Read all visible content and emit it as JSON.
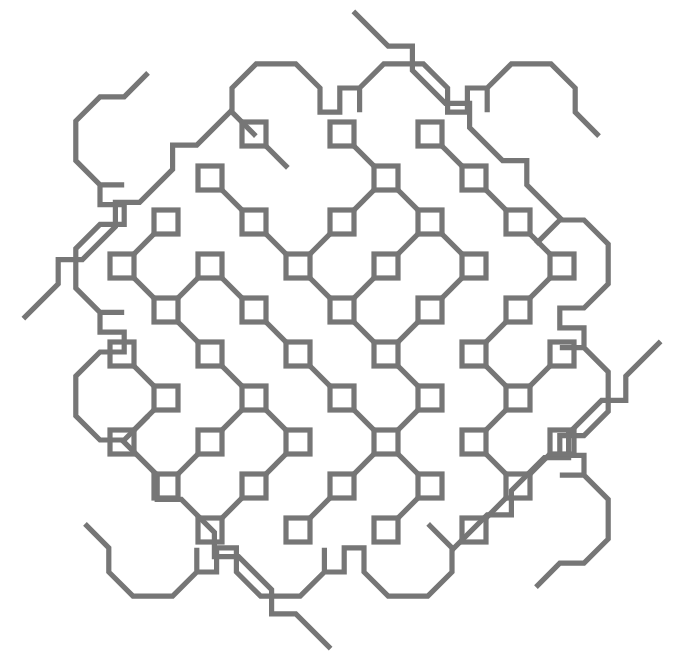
{
  "figure": {
    "type": "line-art",
    "canvas": {
      "width": 685,
      "height": 664,
      "background": "#ffffff"
    },
    "stroke": {
      "color": "#767676",
      "width": 5.2,
      "linecap": "square",
      "linejoin": "miter"
    },
    "lattice": {
      "description": "Diagonal lattice of open square nodes joined by 45-degree links, clipped to an octagonal/circular boundary",
      "center_x": 342,
      "center_y": 330,
      "half_spacing": 44,
      "node_size": 24,
      "node_count": 61,
      "radius": 300
    },
    "nodes": [
      [
        254,
        134
      ],
      [
        342,
        134
      ],
      [
        430,
        134
      ],
      [
        210,
        178
      ],
      [
        386,
        178
      ],
      [
        474,
        178
      ],
      [
        166,
        222
      ],
      [
        254,
        222
      ],
      [
        342,
        222
      ],
      [
        430,
        222
      ],
      [
        518,
        222
      ],
      [
        122,
        266
      ],
      [
        210,
        266
      ],
      [
        298,
        266
      ],
      [
        386,
        266
      ],
      [
        474,
        266
      ],
      [
        562,
        266
      ],
      [
        166,
        310
      ],
      [
        254,
        310
      ],
      [
        342,
        310
      ],
      [
        430,
        310
      ],
      [
        518,
        310
      ],
      [
        122,
        354
      ],
      [
        210,
        354
      ],
      [
        298,
        354
      ],
      [
        386,
        354
      ],
      [
        474,
        354
      ],
      [
        562,
        354
      ],
      [
        166,
        398
      ],
      [
        254,
        398
      ],
      [
        342,
        398
      ],
      [
        430,
        398
      ],
      [
        518,
        398
      ],
      [
        122,
        442
      ],
      [
        210,
        442
      ],
      [
        298,
        442
      ],
      [
        386,
        442
      ],
      [
        474,
        442
      ],
      [
        562,
        442
      ],
      [
        166,
        486
      ],
      [
        254,
        486
      ],
      [
        342,
        486
      ],
      [
        430,
        486
      ],
      [
        518,
        486
      ],
      [
        210,
        530
      ],
      [
        298,
        530
      ],
      [
        386,
        530
      ],
      [
        474,
        530
      ]
    ],
    "links": [
      [
        254,
        134,
        298,
        178
      ],
      [
        342,
        134,
        386,
        178
      ],
      [
        430,
        134,
        474,
        178
      ],
      [
        210,
        178,
        254,
        222
      ],
      [
        386,
        178,
        342,
        222
      ],
      [
        386,
        178,
        430,
        222
      ],
      [
        474,
        178,
        518,
        222
      ],
      [
        166,
        222,
        122,
        266
      ],
      [
        254,
        222,
        298,
        266
      ],
      [
        342,
        222,
        298,
        266
      ],
      [
        430,
        222,
        386,
        266
      ],
      [
        430,
        222,
        474,
        266
      ],
      [
        518,
        222,
        562,
        266
      ],
      [
        122,
        266,
        166,
        310
      ],
      [
        210,
        266,
        166,
        310
      ],
      [
        210,
        266,
        254,
        310
      ],
      [
        298,
        266,
        342,
        310
      ],
      [
        386,
        266,
        342,
        310
      ],
      [
        474,
        266,
        430,
        310
      ],
      [
        562,
        266,
        518,
        310
      ],
      [
        166,
        310,
        210,
        354
      ],
      [
        254,
        310,
        298,
        354
      ],
      [
        342,
        310,
        386,
        354
      ],
      [
        430,
        310,
        386,
        354
      ],
      [
        518,
        310,
        474,
        354
      ],
      [
        122,
        354,
        166,
        398
      ],
      [
        210,
        354,
        254,
        398
      ],
      [
        298,
        354,
        342,
        398
      ],
      [
        386,
        354,
        430,
        398
      ],
      [
        474,
        354,
        518,
        398
      ],
      [
        562,
        354,
        518,
        398
      ],
      [
        166,
        398,
        122,
        442
      ],
      [
        254,
        398,
        210,
        442
      ],
      [
        254,
        398,
        298,
        442
      ],
      [
        342,
        398,
        386,
        442
      ],
      [
        430,
        398,
        386,
        442
      ],
      [
        518,
        398,
        474,
        442
      ],
      [
        210,
        442,
        166,
        486
      ],
      [
        298,
        442,
        254,
        486
      ],
      [
        386,
        442,
        342,
        486
      ],
      [
        386,
        442,
        430,
        486
      ],
      [
        474,
        442,
        518,
        486
      ],
      [
        562,
        442,
        518,
        486
      ],
      [
        254,
        486,
        210,
        530
      ],
      [
        342,
        486,
        298,
        530
      ],
      [
        430,
        486,
        386,
        530
      ],
      [
        518,
        486,
        474,
        530
      ]
    ],
    "boundary": {
      "description": "Scalloped octagonal outline with square-notch and lobe motifs on all four sides",
      "lobe_count_top": 3,
      "lobe_count_bottom": 4
    }
  }
}
